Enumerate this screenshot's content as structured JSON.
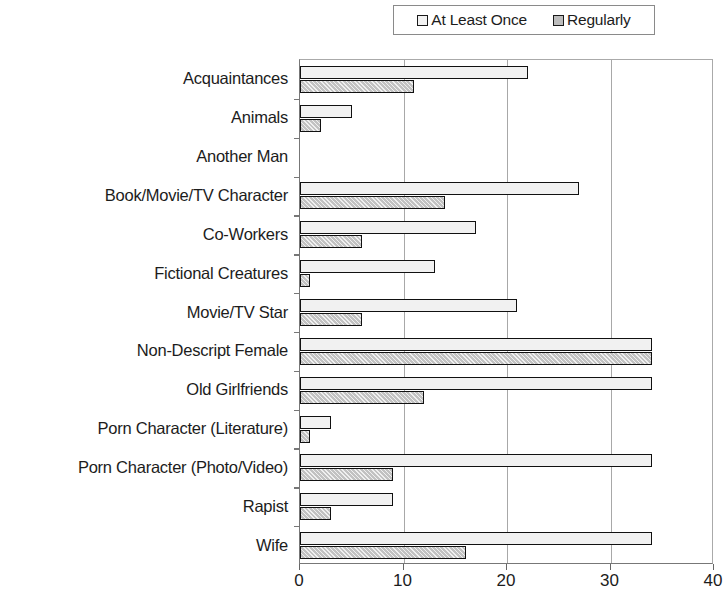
{
  "chart_data": {
    "type": "bar",
    "orientation": "horizontal",
    "title": "",
    "xlabel": "",
    "ylabel": "",
    "xlim": [
      0,
      40
    ],
    "xticks": [
      0,
      10,
      20,
      30,
      40
    ],
    "grid": "vertical",
    "legend_position": "top",
    "categories": [
      "Acquaintances",
      "Animals",
      "Another Man",
      "Book/Movie/TV Character",
      "Co-Workers",
      "Fictional Creatures",
      "Movie/TV Star",
      "Non-Descript Female",
      "Old Girlfriends",
      "Porn Character (Literature)",
      "Porn Character (Photo/Video)",
      "Rapist",
      "Wife"
    ],
    "series": [
      {
        "name": "At Least Once",
        "color": "#f1f1f1",
        "values": [
          22,
          5,
          0,
          27,
          17,
          13,
          21,
          34,
          34,
          3,
          34,
          9,
          34
        ]
      },
      {
        "name": "Regularly",
        "color": "#c2c2c2",
        "values": [
          11,
          2,
          0,
          14,
          6,
          1,
          6,
          34,
          12,
          1,
          9,
          3,
          16
        ]
      }
    ]
  },
  "legend": {
    "entries": [
      {
        "label": "At Least Once",
        "swatch": "series-once"
      },
      {
        "label": "Regularly",
        "swatch": "series-regular"
      }
    ]
  },
  "axis": {
    "x_tick_labels": [
      "0",
      "10",
      "20",
      "30",
      "40"
    ]
  }
}
